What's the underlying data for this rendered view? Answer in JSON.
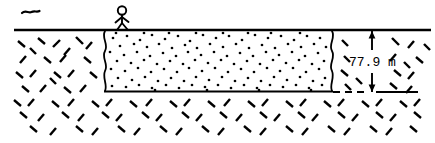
{
  "figure": {
    "kind": "geotechnical cross-section sketch",
    "background_color": "#ffffff",
    "ink_color": "#000000",
    "width": 435,
    "height": 143
  },
  "annotations": {
    "depth_label": "77.9 m",
    "depth_value": 77.9,
    "depth_unit": "m"
  },
  "elements": {
    "bird_mark_name": "bird-tilde-mark",
    "person_name": "stick-figure-person",
    "ground_line_name": "ground-surface-line",
    "soil_layer_name": "granular-soil-layer",
    "rock_hatch_name": "surrounding-rock-hatch",
    "dimension_name": "depth-dimension"
  },
  "geometry": {
    "ground_line": {
      "x1": 14,
      "y1": 30,
      "x2": 430,
      "y2": 30
    },
    "layer_box": {
      "left": 104,
      "right": 332,
      "top": 30,
      "bottom": 92
    },
    "dimension_line_x": 372,
    "dimension_top_y": 31,
    "dimension_bottom_y": 92,
    "label_position": {
      "x": 349,
      "y": 66
    }
  },
  "stipple": {
    "description": "scattered round dots representing granular sand fill",
    "dot_radius": 1.35,
    "dot_count": 150
  },
  "hatch": {
    "description": "short angled dashes representing rock / till",
    "dash_length": 9,
    "dash_thickness": 2.4
  }
}
